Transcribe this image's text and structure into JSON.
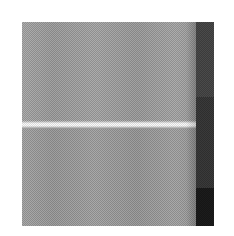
{
  "page": {
    "background_color": "#ffffff",
    "width": 234,
    "height": 236
  },
  "plate": {
    "name": "dithered-image-plate",
    "x": 22,
    "y": 22,
    "width": 192,
    "height": 204,
    "base_color": "#a6a6a6",
    "screen": "ordered-dither-50",
    "description": "Halftone screened grayscale plate"
  },
  "regions": [
    {
      "name": "field-upper",
      "label": "Upper grey field",
      "x": 0,
      "y": 0,
      "width": 174,
      "height": 100,
      "color": "#a8a8a8",
      "tone": "mid-grey"
    },
    {
      "name": "highlight-stripe",
      "label": "Bright horizontal highlight band",
      "x": 0,
      "y": 98,
      "width": 174,
      "height": 9,
      "color": "#e8e8e8",
      "tone": "highlight"
    },
    {
      "name": "field-lower",
      "label": "Lower grey field",
      "x": 0,
      "y": 105,
      "width": 174,
      "height": 99,
      "color": "#a4a4a4",
      "tone": "mid-grey"
    },
    {
      "name": "band-dark-upper",
      "label": "Right band, upper dark segment",
      "x": 174,
      "y": 0,
      "width": 18,
      "height": 75,
      "color": "#4a4a4a",
      "tone": "dark"
    },
    {
      "name": "band-dark-middle",
      "label": "Right band, middle darker segment",
      "x": 174,
      "y": 75,
      "width": 18,
      "height": 91,
      "color": "#3a3a3a",
      "tone": "darker"
    },
    {
      "name": "band-dark-lower",
      "label": "Right band, lower near-black segment",
      "x": 174,
      "y": 166,
      "width": 18,
      "height": 38,
      "color": "#1c1c1c",
      "tone": "near-black"
    }
  ],
  "seam": {
    "name": "band-seam",
    "label": "Vertical seam shading left of dark band",
    "x": 164,
    "y": 0,
    "width": 10,
    "height": 204
  }
}
